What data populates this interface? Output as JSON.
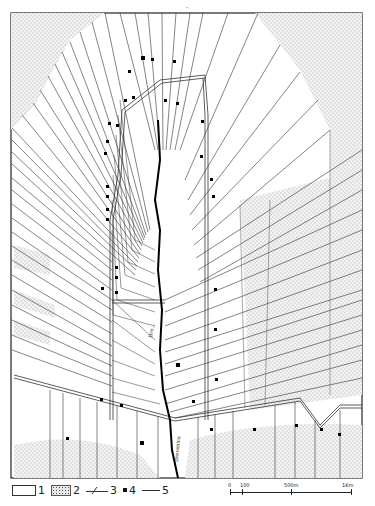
{
  "figure": {
    "page_mark": ".",
    "colors": {
      "ink": "#1a1a1a",
      "stipple_bg": "#eeeeee",
      "stipple_dot": "#555555",
      "paper": "#ffffff"
    }
  },
  "map": {
    "river_label_upper": "Dre...",
    "river_label_lower": "Drevenica",
    "features": {
      "river": "river course running north-south through center",
      "radial_plots": "fan-shaped strip fields radiating from central axis",
      "rectangular_plots": "parallel strip fields in lower section",
      "farmsteads": "small black square markers along roads"
    }
  },
  "legend": {
    "items": [
      {
        "num": "1",
        "symbol": "blank-field"
      },
      {
        "num": "2",
        "symbol": "stippled-field"
      },
      {
        "num": "3",
        "symbol": "road-canal"
      },
      {
        "num": "4",
        "symbol": "farmstead-square"
      },
      {
        "num": "5",
        "symbol": "boundary-line"
      }
    ]
  },
  "scale_bar": {
    "labels": [
      "0",
      "100",
      "500m",
      "1Km"
    ],
    "positions": [
      0,
      0.1,
      0.5,
      1.0
    ]
  }
}
